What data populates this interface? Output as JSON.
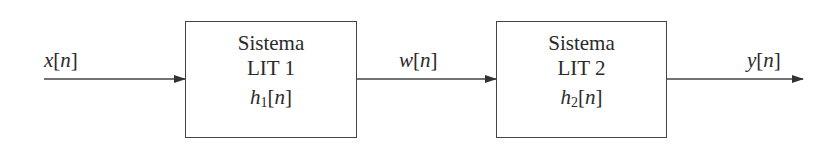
{
  "diagram": {
    "type": "block-diagram",
    "blocks": [
      {
        "id": "lti1",
        "line1": "Sistema",
        "line2": "LIT 1",
        "impulse_fn": "h",
        "impulse_sub": "1",
        "impulse_arg": "n"
      },
      {
        "id": "lti2",
        "line1": "Sistema",
        "line2": "LIT 2",
        "impulse_fn": "h",
        "impulse_sub": "2",
        "impulse_arg": "n"
      }
    ],
    "signals": {
      "input": {
        "fn": "x",
        "arg": "n"
      },
      "intermediate": {
        "fn": "w",
        "arg": "n"
      },
      "output": {
        "fn": "y",
        "arg": "n"
      }
    },
    "colors": {
      "stroke": "#444444",
      "text": "#2a2a2a",
      "background": "#ffffff"
    }
  }
}
